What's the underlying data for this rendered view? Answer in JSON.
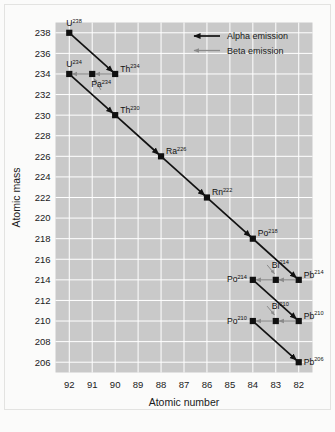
{
  "chart_data": {
    "type": "scatter",
    "title": "",
    "xlabel": "Atomic number",
    "ylabel": "Atomic mass",
    "xticks": [
      92,
      91,
      90,
      89,
      88,
      87,
      86,
      85,
      84,
      83,
      82
    ],
    "yticks": [
      238,
      236,
      234,
      232,
      230,
      228,
      226,
      224,
      222,
      220,
      218,
      216,
      214,
      212,
      210,
      208,
      206
    ],
    "xlim": [
      92.6,
      81.4
    ],
    "ylim": [
      205,
      239
    ],
    "grid": true,
    "legend_position": "top-right",
    "plot_bg": "#c9c9c9",
    "grid_color": "#ffffff",
    "points": [
      {
        "label": "U",
        "mass": "238",
        "x": 92,
        "y": 238,
        "label_pos": "above-left"
      },
      {
        "label": "Th",
        "mass": "234",
        "x": 90,
        "y": 234,
        "label_pos": "above-right"
      },
      {
        "label": "Pa",
        "mass": "234",
        "x": 91,
        "y": 234,
        "label_pos": "below-right"
      },
      {
        "label": "U",
        "mass": "234",
        "x": 92,
        "y": 234,
        "label_pos": "above-left"
      },
      {
        "label": "Th",
        "mass": "230",
        "x": 90,
        "y": 230,
        "label_pos": "above-right"
      },
      {
        "label": "Ra",
        "mass": "226",
        "x": 88,
        "y": 226,
        "label_pos": "above-right"
      },
      {
        "label": "Rn",
        "mass": "222",
        "x": 86,
        "y": 222,
        "label_pos": "above-right"
      },
      {
        "label": "Po",
        "mass": "218",
        "x": 84,
        "y": 218,
        "label_pos": "above-right"
      },
      {
        "label": "Pb",
        "mass": "214",
        "x": 82,
        "y": 214,
        "label_pos": "above-right"
      },
      {
        "label": "Bi",
        "mass": "214",
        "x": 83,
        "y": 214,
        "label_pos": "above-center"
      },
      {
        "label": "Po",
        "mass": "214",
        "x": 84,
        "y": 214,
        "label_pos": "left"
      },
      {
        "label": "Pb",
        "mass": "210",
        "x": 82,
        "y": 210,
        "label_pos": "above-right"
      },
      {
        "label": "Bi",
        "mass": "210",
        "x": 83,
        "y": 210,
        "label_pos": "above-center"
      },
      {
        "label": "Po",
        "mass": "210",
        "x": 84,
        "y": 210,
        "label_pos": "left"
      },
      {
        "label": "Pb",
        "mass": "206",
        "x": 82,
        "y": 206,
        "label_pos": "right"
      }
    ],
    "decays": [
      {
        "from": [
          92,
          238
        ],
        "to": [
          90,
          234
        ],
        "type": "alpha"
      },
      {
        "from": [
          90,
          234
        ],
        "to": [
          91,
          234
        ],
        "type": "beta"
      },
      {
        "from": [
          91,
          234
        ],
        "to": [
          92,
          234
        ],
        "type": "beta"
      },
      {
        "from": [
          92,
          234
        ],
        "to": [
          90,
          230
        ],
        "type": "alpha"
      },
      {
        "from": [
          90,
          230
        ],
        "to": [
          88,
          226
        ],
        "type": "alpha"
      },
      {
        "from": [
          88,
          226
        ],
        "to": [
          86,
          222
        ],
        "type": "alpha"
      },
      {
        "from": [
          86,
          222
        ],
        "to": [
          84,
          218
        ],
        "type": "alpha"
      },
      {
        "from": [
          84,
          218
        ],
        "to": [
          82,
          214
        ],
        "type": "alpha"
      },
      {
        "from": [
          82,
          214
        ],
        "to": [
          83,
          214
        ],
        "type": "beta"
      },
      {
        "from": [
          83,
          214
        ],
        "to": [
          84,
          214
        ],
        "type": "beta"
      },
      {
        "from": [
          84,
          214
        ],
        "to": [
          82,
          210
        ],
        "type": "alpha"
      },
      {
        "from": [
          82,
          210
        ],
        "to": [
          83,
          210
        ],
        "type": "beta"
      },
      {
        "from": [
          83,
          210
        ],
        "to": [
          84,
          210
        ],
        "type": "beta"
      },
      {
        "from": [
          84,
          210
        ],
        "to": [
          82,
          206
        ],
        "type": "alpha"
      }
    ],
    "leaders": [
      {
        "from": [
          90.62,
          232.45
        ],
        "to": [
          90.92,
          233.55
        ]
      },
      {
        "from": [
          83.38,
          215.45
        ],
        "to": [
          83.06,
          214.6
        ]
      },
      {
        "from": [
          83.38,
          211.45
        ],
        "to": [
          83.06,
          210.6
        ]
      }
    ],
    "legend": [
      {
        "label": "Alpha emission",
        "type": "alpha",
        "color": "#121212"
      },
      {
        "label": "Beta emission",
        "type": "beta",
        "color": "#8a8a8a"
      }
    ],
    "series_colors": {
      "alpha": "#121212",
      "beta": "#8a8a8a",
      "marker": "#101010"
    }
  }
}
